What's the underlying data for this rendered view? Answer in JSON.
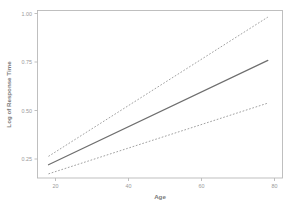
{
  "chart_data": {
    "type": "line",
    "title": "",
    "xlabel": "Age",
    "ylabel": "Log of Response Time",
    "xlim": [
      15,
      82
    ],
    "ylim": [
      0.13,
      1.02
    ],
    "xticks": [
      20,
      40,
      60,
      80
    ],
    "xtick_labels": [
      "20",
      "40",
      "60",
      "80"
    ],
    "yticks": [
      0.25,
      0.5,
      0.75,
      1.0
    ],
    "ytick_labels": [
      "0.25",
      "0.50",
      "0.75",
      "1.00"
    ],
    "grid": false,
    "legend": null,
    "series": [
      {
        "name": "Fitted regression line",
        "style": "solid",
        "color": "#6e6e6e",
        "x": [
          18,
          78
        ],
        "values": [
          0.2,
          0.755
        ]
      },
      {
        "name": "Upper confidence band",
        "style": "dashed",
        "color": "#9c9c9c",
        "x": [
          18,
          78
        ],
        "values": [
          0.245,
          0.985
        ]
      },
      {
        "name": "Lower confidence band",
        "style": "dashed",
        "color": "#9c9c9c",
        "x": [
          18,
          78
        ],
        "values": [
          0.152,
          0.528
        ]
      }
    ]
  },
  "axes": {
    "x_title": "Age",
    "y_title": "Log of Response Time",
    "x_tick_labels": [
      "20",
      "40",
      "60",
      "80"
    ],
    "y_tick_labels": [
      "1.00",
      "0.75",
      "0.50",
      "0.25"
    ]
  },
  "colors": {
    "background": "#ffffff",
    "frame": "#b9b9b9",
    "fit_line": "#6e6e6e",
    "band_line": "#9c9c9c",
    "tick_text": "#9a9a9a",
    "title_text": "#7a7a7a"
  }
}
